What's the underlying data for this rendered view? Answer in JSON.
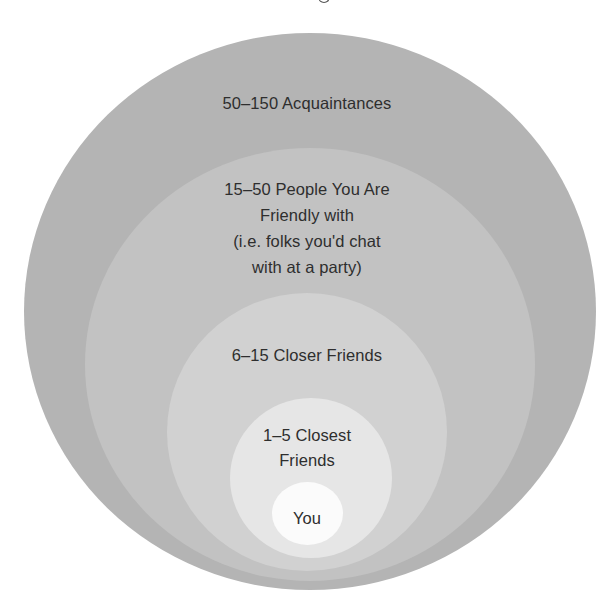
{
  "diagram": {
    "type": "concentric-circles",
    "title_fragment_visible": true,
    "colors": {
      "ring_acquaintances": "#b4b4b4",
      "ring_friendly": "#c2c2c2",
      "ring_closer": "#d1d1d1",
      "ring_closest": "#e6e6e6",
      "center_you": "#fbfbfb",
      "text": "#2e2e2e"
    },
    "rings": [
      {
        "id": "acquaintances",
        "lines": [
          "50–150 Acquaintances"
        ]
      },
      {
        "id": "friendly",
        "lines": [
          "15–50 People You Are",
          "Friendly with",
          "(i.e. folks you'd chat",
          "with at a party)"
        ]
      },
      {
        "id": "closer",
        "lines": [
          "6–15 Closer Friends"
        ]
      },
      {
        "id": "closest",
        "lines": [
          "1–5 Closest",
          "Friends"
        ]
      },
      {
        "id": "you",
        "lines": [
          "You"
        ]
      }
    ]
  }
}
